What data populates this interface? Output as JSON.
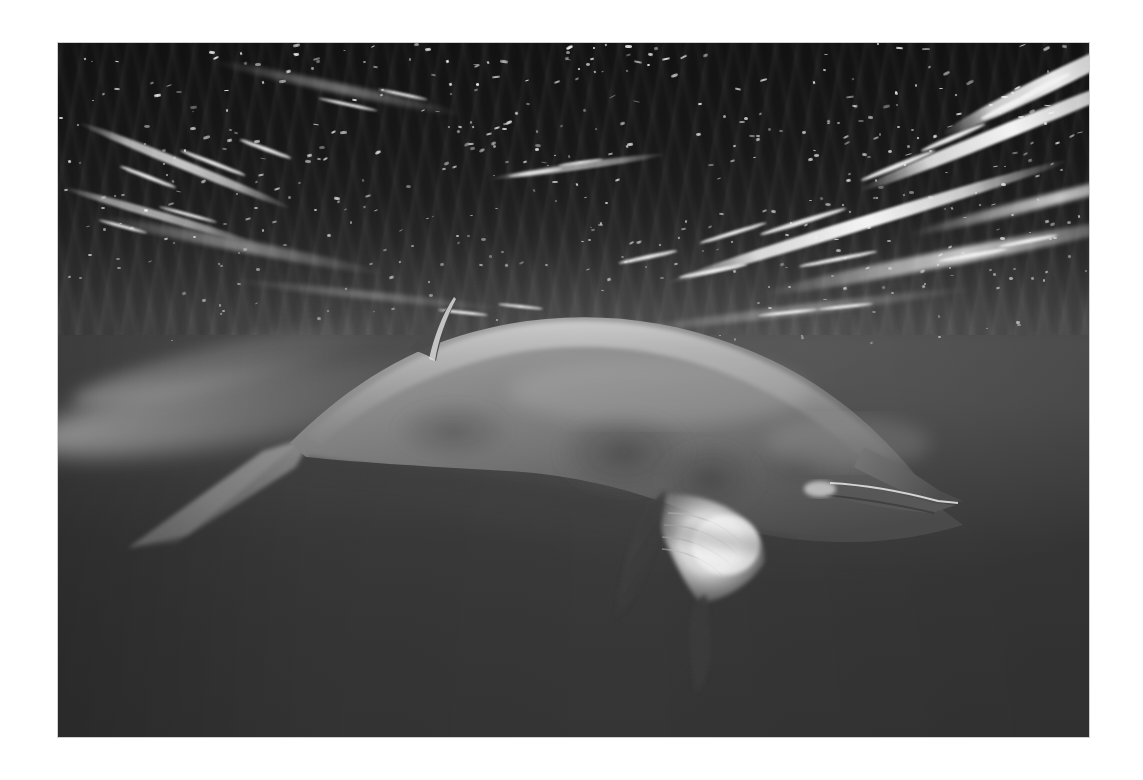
{
  "page": {
    "background_color": "#ffffff",
    "width": 1143,
    "height": 780
  },
  "photo": {
    "title": "Minke whale swimming beneath the ocean surface",
    "medium": "black and white photograph",
    "orientation": "landscape",
    "frame": {
      "left": 58,
      "top": 43,
      "width": 1031,
      "height": 694,
      "border_color": "#cfcfcf"
    },
    "palette": {
      "surface_dark": "#1a1a1a",
      "water_mid": "#4e4e4e",
      "water_deep": "#353535",
      "highlight_white": "#ffffff",
      "whale_body_light": "#8e8e8e",
      "whale_body_mid": "#6b6b6b",
      "whale_body_dark": "#474747",
      "whale_belly": "#e8e8e8"
    },
    "scene": {
      "subject": "minke whale",
      "heading": "swimming toward the right, rostrum at right, flukes trailing to lower left",
      "surface_band_label": "sunlit rippled water surface with specular glitter",
      "mid_water_label": "open mid-water column, lighter toward the centre right",
      "deep_water_label": "dark deep water in lower half"
    },
    "anatomy": [
      {
        "name": "rostrum",
        "label": "pointed snout with mouth line",
        "x": 935,
        "y": 487
      },
      {
        "name": "dorsal-fin",
        "label": "small falcate dorsal fin",
        "x": 420,
        "y": 320
      },
      {
        "name": "pectoral-fin",
        "label": "dark pectoral flipper",
        "x": 655,
        "y": 540
      },
      {
        "name": "ventral-pleats",
        "label": "bright white throat pleats",
        "x": 690,
        "y": 505
      },
      {
        "name": "tail-stock",
        "label": "tapering tail stock",
        "x": 250,
        "y": 450
      },
      {
        "name": "fluke-tip",
        "label": "trailing fluke tip",
        "x": 128,
        "y": 545
      }
    ]
  }
}
